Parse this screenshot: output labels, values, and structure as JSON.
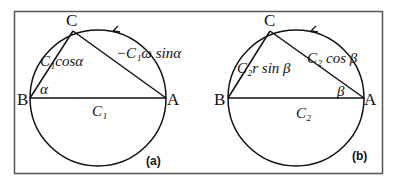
{
  "figure": {
    "frame": {
      "x": 14,
      "y": 11,
      "width": 368,
      "height": 162
    },
    "panels": [
      {
        "tag": "(a)",
        "circle": {
          "cx": 98,
          "cy": 98,
          "r": 68
        },
        "points": {
          "B": "B",
          "A": "A",
          "C": "C"
        },
        "labels": {
          "bc": "C₁cosα",
          "ca": "−C₁ω sinα",
          "ba": "C₁",
          "angle": "α"
        }
      },
      {
        "tag": "(b)",
        "circle": {
          "cx": 296,
          "cy": 98,
          "r": 68
        },
        "points": {
          "B": "B",
          "A": "A",
          "C": "C"
        },
        "labels": {
          "bc": "C₂r sin β",
          "ca": "C₂ cos β",
          "ba": "C₂",
          "angle": "β"
        }
      }
    ],
    "colors": {
      "stroke": "#111111",
      "frame": "#555555"
    }
  }
}
